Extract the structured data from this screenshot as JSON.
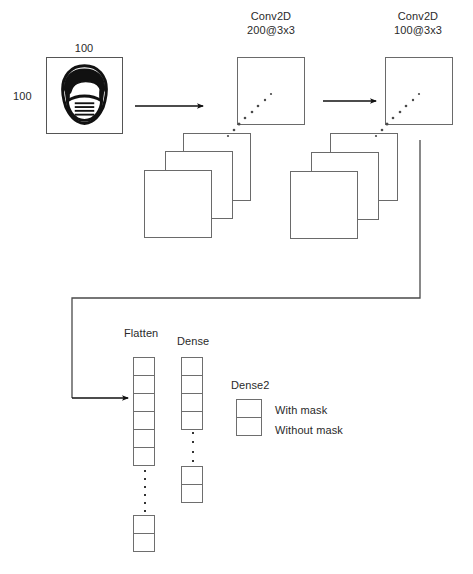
{
  "diagram": {
    "title_text": "",
    "input": {
      "name": "input-image",
      "width_label": "100",
      "height_label": "100",
      "icon": "masked-face-icon",
      "alt": "Face with mask"
    },
    "blocks": [
      {
        "id": "conv1",
        "layer_label": "Conv2D",
        "spec_label": "200@3x3",
        "feature_map_count": 4
      },
      {
        "id": "conv2",
        "layer_label": "Conv2D",
        "spec_label": "100@3x3",
        "feature_map_count": 4
      }
    ],
    "flatten": {
      "label": "Flatten",
      "top_cells": 6,
      "bottom_cells": 2,
      "dot_count": 6
    },
    "dense": {
      "label": "Dense",
      "top_cells": 4,
      "bottom_cells": 2,
      "dot_count": 4
    },
    "dense2": {
      "label": "Dense2",
      "cells": 2,
      "legend": [
        {
          "text": "With mask"
        },
        {
          "text": "Without mask"
        }
      ]
    },
    "arrows": [
      {
        "name": "arrow-input-to-conv1"
      },
      {
        "name": "arrow-conv1-to-conv2"
      },
      {
        "name": "arrow-conv2-to-flatten"
      }
    ],
    "colors": {
      "stroke": "#555555",
      "line": "#4a4a4a",
      "text": "#2a2a2a",
      "background": "#ffffff"
    }
  }
}
